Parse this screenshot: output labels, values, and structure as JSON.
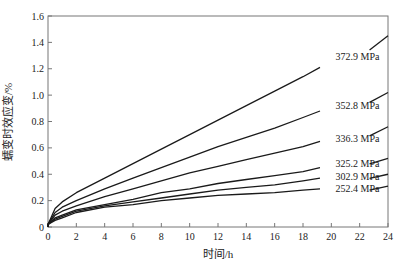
{
  "chart_data": {
    "type": "line",
    "title": "",
    "xlabel": "时间/h",
    "ylabel": "蠕变时效应变/%",
    "xlim": [
      0,
      24
    ],
    "ylim": [
      0,
      1.6
    ],
    "xticks": [
      0,
      2,
      4,
      6,
      8,
      10,
      12,
      14,
      16,
      18,
      20,
      22,
      24
    ],
    "yticks": [
      0,
      0.2,
      0.4,
      0.6,
      0.8,
      1.0,
      1.2,
      1.4,
      1.6
    ],
    "ytick_labels": [
      "0",
      "0.2",
      "0.4",
      "0.6",
      "0.8",
      "1.0",
      "1.2",
      "1.4",
      "1.6"
    ],
    "grid": false,
    "legend": "inline labels at right end of curves",
    "x": [
      0,
      0.5,
      1,
      2,
      4,
      6,
      8,
      10,
      12,
      14,
      16,
      18,
      19.2
    ],
    "series": [
      {
        "name": "372.9 MPa",
        "values": [
          0.02,
          0.14,
          0.19,
          0.26,
          0.37,
          0.48,
          0.59,
          0.7,
          0.81,
          0.92,
          1.03,
          1.14,
          1.21
        ],
        "end": {
          "x": 24,
          "y": 1.45
        }
      },
      {
        "name": "352.8 MPa",
        "values": [
          0.02,
          0.11,
          0.15,
          0.2,
          0.29,
          0.37,
          0.45,
          0.53,
          0.61,
          0.68,
          0.75,
          0.83,
          0.88
        ],
        "end": {
          "x": 24,
          "y": 1.02
        }
      },
      {
        "name": "336.3 MPa",
        "values": [
          0.02,
          0.09,
          0.12,
          0.16,
          0.23,
          0.29,
          0.35,
          0.41,
          0.46,
          0.51,
          0.56,
          0.61,
          0.65
        ],
        "end": {
          "x": 24,
          "y": 0.76
        }
      },
      {
        "name": "325.2 MPa",
        "values": [
          0.02,
          0.07,
          0.09,
          0.13,
          0.17,
          0.21,
          0.26,
          0.29,
          0.33,
          0.36,
          0.39,
          0.42,
          0.45
        ],
        "end": {
          "x": 24,
          "y": 0.52
        }
      },
      {
        "name": "302.9 MPa",
        "values": [
          0.02,
          0.06,
          0.08,
          0.12,
          0.16,
          0.19,
          0.22,
          0.25,
          0.28,
          0.3,
          0.32,
          0.35,
          0.37
        ],
        "end": {
          "x": 24,
          "y": 0.4
        }
      },
      {
        "name": "252.4 MPa",
        "values": [
          0.02,
          0.05,
          0.07,
          0.11,
          0.15,
          0.17,
          0.2,
          0.22,
          0.24,
          0.25,
          0.26,
          0.28,
          0.29
        ],
        "end": {
          "x": 24,
          "y": 0.31
        }
      }
    ],
    "label_positions": [
      {
        "name": "372.9 MPa",
        "x": 20.3,
        "y": 1.29
      },
      {
        "name": "352.8 MPa",
        "x": 20.3,
        "y": 0.92
      },
      {
        "name": "336.3 MPa",
        "x": 20.3,
        "y": 0.67
      },
      {
        "name": "325.2 MPa",
        "x": 20.3,
        "y": 0.48
      },
      {
        "name": "302.9 MPa",
        "x": 20.3,
        "y": 0.38
      },
      {
        "name": "252.4 MPa",
        "x": 20.3,
        "y": 0.29
      }
    ],
    "line_color": "#1a1a1a"
  }
}
